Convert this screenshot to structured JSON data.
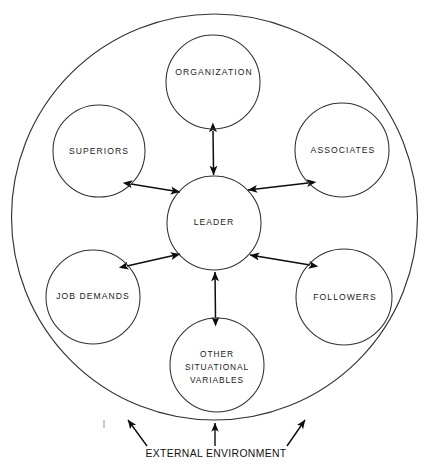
{
  "diagram": {
    "outer_boundary_label": "EXTERNAL ENVIRONMENT",
    "colors": {
      "background": "#ffffff",
      "circle_stroke": "#303030",
      "outer_stroke": "#333333",
      "arrow": "#0d0d0d",
      "text": "#1a1a1a"
    },
    "center_node": {
      "id": "leader",
      "label": "LEADER",
      "cx": 214,
      "cy": 223,
      "r": 47
    },
    "satellite_nodes": [
      {
        "id": "organization",
        "label": "ORGANIZATION",
        "lines": [
          "ORGANIZATION"
        ],
        "cx": 213,
        "cy": 82,
        "r": 47,
        "arrow": "bidirectional"
      },
      {
        "id": "associates",
        "label": "ASSOCIATES",
        "lines": [
          "ASSOCIATES"
        ],
        "cx": 342,
        "cy": 150,
        "r": 47,
        "arrow": "bidirectional"
      },
      {
        "id": "followers",
        "label": "FOLLOWERS",
        "lines": [
          "FOLLOWERS"
        ],
        "cx": 344,
        "cy": 297,
        "r": 48,
        "arrow": "bidirectional"
      },
      {
        "id": "other-situational-variables",
        "label": "OTHER SITUATIONAL VARIABLES",
        "lines": [
          "OTHER",
          "SITUATIONAL",
          "VARIABLES"
        ],
        "cx": 217,
        "cy": 365,
        "r": 47,
        "arrow": "bidirectional"
      },
      {
        "id": "job-demands",
        "label": "JOB DEMANDS",
        "lines": [
          "JOB DEMANDS"
        ],
        "cx": 93,
        "cy": 297,
        "r": 47,
        "arrow": "bidirectional"
      },
      {
        "id": "superiors",
        "label": "SUPERIORS",
        "lines": [
          "SUPERIORS"
        ],
        "cx": 99,
        "cy": 151,
        "r": 46,
        "arrow": "bidirectional"
      }
    ],
    "outer_boundary": {
      "cx": 214.5,
      "cy": 217,
      "rx": 203,
      "ry": 203
    },
    "environment_arrows": 3
  }
}
